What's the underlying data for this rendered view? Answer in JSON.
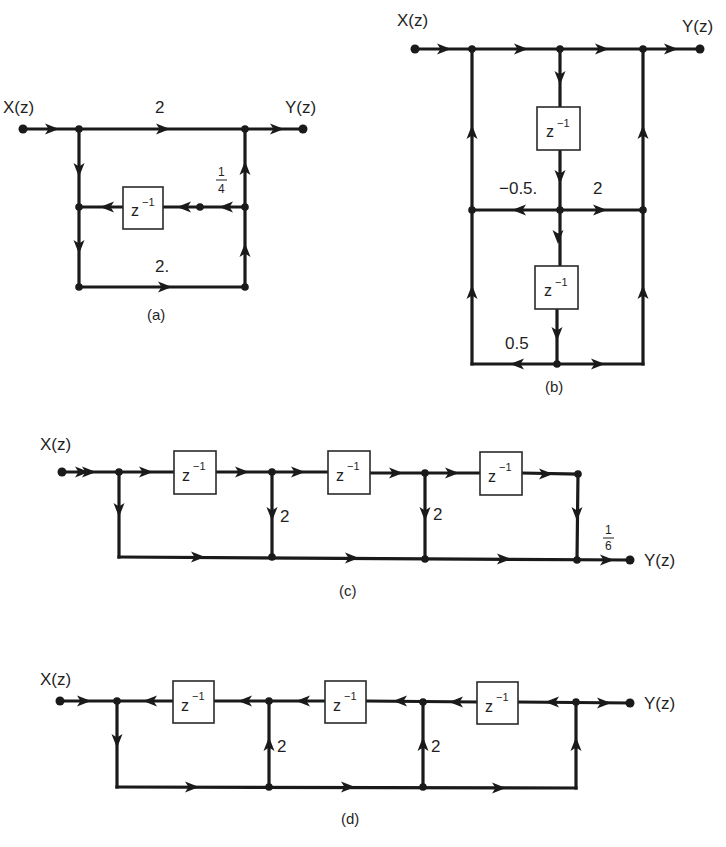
{
  "figure": {
    "colors": {
      "ink": "#1a1a1a",
      "background": "#ffffff"
    },
    "delay_label": {
      "base": "z",
      "exponent": "−1"
    },
    "diagrams": [
      {
        "id": "a",
        "caption": "(a)",
        "input_label": "X(z)",
        "output_label": "Y(z)",
        "gains": {
          "top": "2",
          "bottom": "2.",
          "feedback_num": "1",
          "feedback_den": "4"
        }
      },
      {
        "id": "b",
        "caption": "(b)",
        "input_label": "X(z)",
        "output_label": "Y(z)",
        "gains": {
          "middle_left": "−0.5.",
          "middle_right": "2",
          "bottom_left": "0.5"
        }
      },
      {
        "id": "c",
        "caption": "(c)",
        "input_label": "X(z)",
        "output_label": "Y(z)",
        "gains": {
          "tap1": "2",
          "tap2": "2",
          "out_num": "1",
          "out_den": "6"
        }
      },
      {
        "id": "d",
        "caption": "(d)",
        "input_label": "X(z)",
        "output_label": "Y(z)",
        "gains": {
          "tap1": "2",
          "tap2": "2"
        }
      }
    ]
  }
}
